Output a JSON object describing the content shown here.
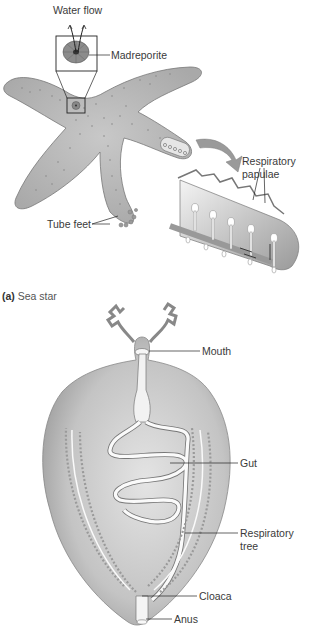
{
  "figure": {
    "panel_a": {
      "caption_letter": "(a)",
      "caption_text": "Sea star",
      "labels": {
        "water_flow": "Water flow",
        "madreporite": "Madreporite",
        "respiratory_papulae_line1": "Respiratory",
        "respiratory_papulae_line2": "papulae",
        "tube_feet": "Tube feet"
      }
    },
    "panel_b": {
      "labels": {
        "mouth": "Mouth",
        "gut": "Gut",
        "respiratory_tree_line1": "Respiratory",
        "respiratory_tree_line2": "tree",
        "cloaca": "Cloaca",
        "anus": "Anus"
      }
    },
    "colors": {
      "body_fill": "#b4b4b4",
      "body_dark": "#8c8c8c",
      "outline": "#6e6e6e",
      "leader_line": "#222222",
      "background": "#ffffff"
    }
  }
}
